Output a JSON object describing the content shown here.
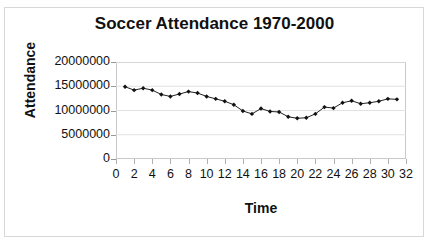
{
  "chart_data": {
    "type": "line",
    "title": "Soccer Attendance 1970-2000",
    "xlabel": "Time",
    "ylabel": "Attendance",
    "xlim": [
      0,
      32
    ],
    "ylim": [
      0,
      20000000
    ],
    "grid": true,
    "legend": "none",
    "marker": "diamond",
    "line_color": "#222222",
    "marker_color": "#111111",
    "x_ticks": [
      0,
      2,
      4,
      6,
      8,
      10,
      12,
      14,
      16,
      18,
      20,
      22,
      24,
      26,
      28,
      30,
      32
    ],
    "y_ticks": [
      0,
      5000000,
      10000000,
      15000000,
      20000000
    ],
    "y_tick_labels": [
      "0",
      "5000000",
      "10000000",
      "15000000",
      "20000000"
    ],
    "x": [
      1,
      2,
      3,
      4,
      5,
      6,
      7,
      8,
      9,
      10,
      11,
      12,
      13,
      14,
      15,
      16,
      17,
      18,
      19,
      20,
      21,
      22,
      23,
      24,
      25,
      26,
      27,
      28,
      29,
      30,
      31
    ],
    "values": [
      14900000,
      14200000,
      14600000,
      14200000,
      13300000,
      12900000,
      13400000,
      13900000,
      13600000,
      12900000,
      12400000,
      11900000,
      11200000,
      9900000,
      9300000,
      10400000,
      9800000,
      9700000,
      8700000,
      8400000,
      8500000,
      9300000,
      10700000,
      10500000,
      11600000,
      12000000,
      11400000,
      11600000,
      11900000,
      12400000,
      12300000
    ],
    "series": [
      {
        "name": "Attendance",
        "values": [
          14900000,
          14200000,
          14600000,
          14200000,
          13300000,
          12900000,
          13400000,
          13900000,
          13600000,
          12900000,
          12400000,
          11900000,
          11200000,
          9900000,
          9300000,
          10400000,
          9800000,
          9700000,
          8700000,
          8400000,
          8500000,
          9300000,
          10700000,
          10500000,
          11600000,
          12000000,
          11400000,
          11600000,
          11900000,
          12400000,
          12300000
        ]
      }
    ]
  }
}
